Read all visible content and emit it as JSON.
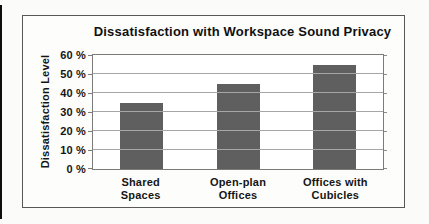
{
  "page": {
    "background": "#fbfbfa"
  },
  "chart_data": {
    "type": "bar",
    "title": "Dissatisfaction with Workspace Sound Privacy",
    "ylabel": "Dissatisfaction Level",
    "xlabel": "",
    "categories": [
      "Shared Spaces",
      "Open-plan Offices",
      "Offices with Cubicles"
    ],
    "categories_display": [
      "Shared\nSpaces",
      "Open-plan\nOffices",
      "Offices with\nCubicles"
    ],
    "values": [
      35,
      45,
      55
    ],
    "unit": "%",
    "ylim": [
      0,
      60
    ],
    "yticks": [
      0,
      10,
      20,
      30,
      40,
      50,
      60
    ],
    "ytick_labels": [
      "0 %",
      "10 %",
      "20 %",
      "30 %",
      "40 %",
      "50 %",
      "60 %"
    ],
    "grid": true,
    "legend": false,
    "colors": {
      "bar": "#5f5f5f",
      "gridline": "#a6a6a6",
      "plot_border": "#7b7b7b",
      "box_border": "#585858",
      "text": "#151515"
    }
  }
}
